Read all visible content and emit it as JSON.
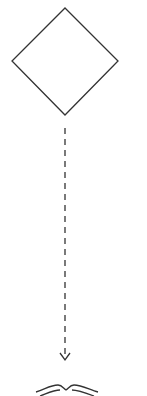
{
  "diagram": {
    "type": "flowchart-fragment",
    "nodes": [
      {
        "id": "decision",
        "shape": "diamond",
        "label": ""
      },
      {
        "id": "bottom-node",
        "shape": "book-like",
        "label": ""
      }
    ],
    "edges": [
      {
        "from": "decision",
        "to": "bottom-node",
        "style": "dashed",
        "arrow": "open"
      }
    ],
    "colors": {
      "stroke": "#333333",
      "background": "#ffffff"
    }
  }
}
